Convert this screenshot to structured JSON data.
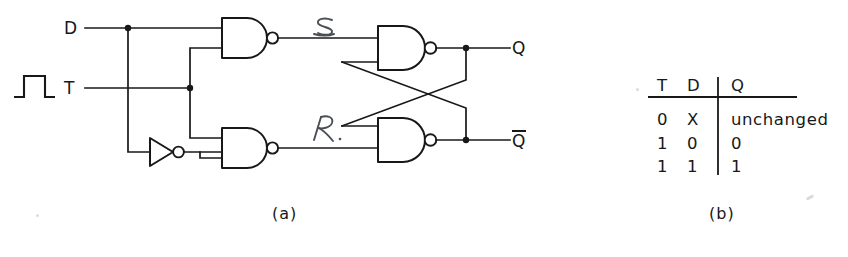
{
  "figure": {
    "kind": "logic-circuit-with-truth-table",
    "captions": {
      "left": "(a)",
      "right": "(b)"
    }
  },
  "circuit": {
    "inputs": [
      {
        "id": "d",
        "label": "D"
      },
      {
        "id": "t",
        "label": "T",
        "icon": "clock-pulse-waveform-icon"
      }
    ],
    "internal_signals": [
      {
        "id": "s",
        "label": "S",
        "style": "handwritten"
      },
      {
        "id": "r",
        "label": "R",
        "style": "handwritten"
      }
    ],
    "outputs": [
      {
        "id": "q",
        "label": "Q"
      },
      {
        "id": "qbar",
        "label": "Q",
        "overbar": true
      }
    ],
    "gates": [
      {
        "id": "nand-s",
        "type": "nand",
        "inputs": 2
      },
      {
        "id": "nand-r",
        "type": "nand",
        "inputs": 2
      },
      {
        "id": "inverter",
        "type": "not",
        "inputs": 1
      },
      {
        "id": "nand-q",
        "type": "nand",
        "inputs": 2
      },
      {
        "id": "nand-qbar",
        "type": "nand",
        "inputs": 2
      }
    ]
  },
  "truth_table": {
    "headers": [
      "T",
      "D",
      "Q"
    ],
    "rows": [
      [
        "0",
        "X",
        "unchanged"
      ],
      [
        "1",
        "0",
        "0"
      ],
      [
        "1",
        "1",
        "1"
      ]
    ]
  },
  "colors": {
    "ink": "#16181a",
    "pencil": "#4a4f55",
    "paper": "#ffffff"
  }
}
